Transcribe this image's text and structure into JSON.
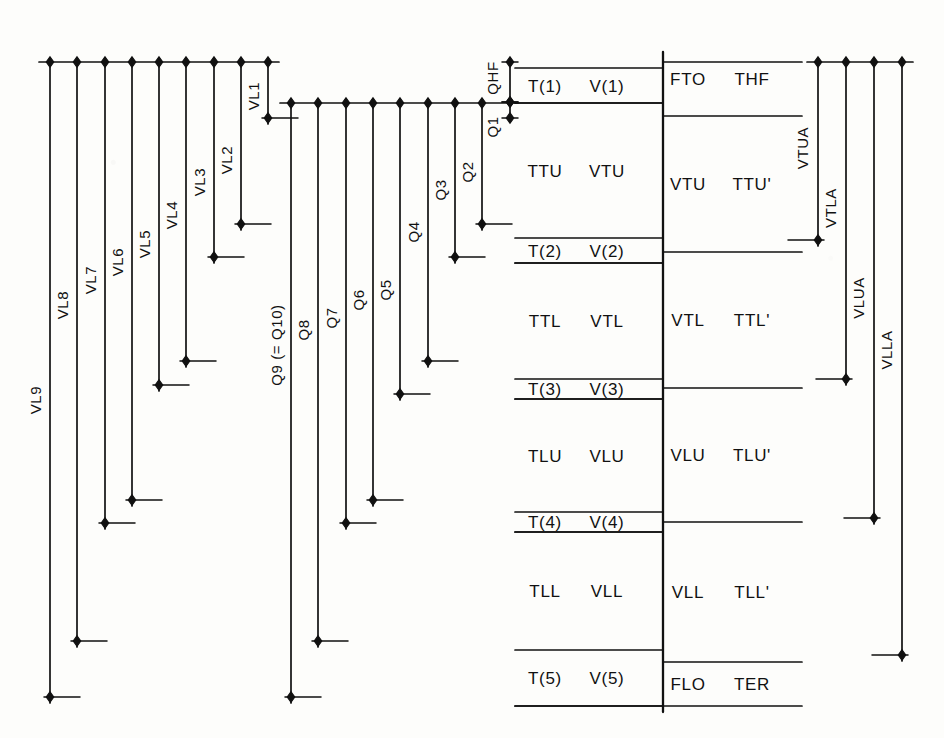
{
  "figure": {
    "kind": "engineering-level-diagram",
    "style": "hand-drawn-ink",
    "width": 944,
    "height": 738,
    "background_color": "#fdfdfb",
    "ink_color": "#111111"
  },
  "panels": {
    "left": {
      "name": "vertical-level-panel",
      "bus_y": 62,
      "x_start": 50,
      "x_step": 27.2,
      "tick_len": 30,
      "lines": [
        {
          "label": "VL9",
          "x": 50,
          "end_y": 697,
          "label_y": 400
        },
        {
          "label": "VL8",
          "x": 77,
          "end_y": 641,
          "label_y": 305
        },
        {
          "label": "VL7",
          "x": 105,
          "end_y": 523,
          "label_y": 280
        },
        {
          "label": "VL6",
          "x": 132,
          "end_y": 500,
          "label_y": 262
        },
        {
          "label": "VL5",
          "x": 159,
          "end_y": 385,
          "label_y": 244
        },
        {
          "label": "VL4",
          "x": 186,
          "end_y": 361,
          "label_y": 215
        },
        {
          "label": "VL3",
          "x": 214,
          "end_y": 257,
          "label_y": 182
        },
        {
          "label": "VL2",
          "x": 241,
          "end_y": 224,
          "label_y": 160
        },
        {
          "label": "VL1",
          "x": 268,
          "end_y": 118,
          "label_y": 96
        }
      ]
    },
    "middle": {
      "name": "charge-level-panel",
      "bus_y": 103,
      "x_start": 291,
      "x_step": 27.4,
      "tick_len": 30,
      "lines": [
        {
          "label": "Q9  (= Q10)",
          "x": 291,
          "end_y": 697,
          "label_y": 345
        },
        {
          "label": "Q8",
          "x": 318,
          "end_y": 641,
          "label_y": 330
        },
        {
          "label": "Q7",
          "x": 346,
          "end_y": 523,
          "label_y": 318
        },
        {
          "label": "Q6",
          "x": 373,
          "end_y": 500,
          "label_y": 300
        },
        {
          "label": "Q5",
          "x": 400,
          "end_y": 394,
          "label_y": 290
        },
        {
          "label": "Q4",
          "x": 428,
          "end_y": 361,
          "label_y": 232
        },
        {
          "label": "Q3",
          "x": 455,
          "end_y": 257,
          "label_y": 190
        },
        {
          "label": "Q2",
          "x": 482,
          "end_y": 224,
          "label_y": 172
        }
      ],
      "stack": [
        {
          "label": "QHF",
          "x": 510,
          "top_y": 62,
          "bottom_y": 102,
          "label_y": 78
        },
        {
          "label": "Q1",
          "x": 510,
          "top_y": 102,
          "bottom_y": 118,
          "label_y": 127
        }
      ]
    },
    "table": {
      "name": "transition-voltage-table",
      "x_left": 515,
      "x_mid": 663,
      "x_right": 802,
      "col_left_labels_x": [
        545,
        607
      ],
      "col_right_labels_x": [
        688,
        752
      ],
      "rows": [
        {
          "kind": "node",
          "y_top": 68,
          "y_bot": 103,
          "left": "T(1)",
          "right": "V(1)"
        },
        {
          "kind": "interval",
          "y_top": 103,
          "y_bot": 238,
          "left": "TTU",
          "right": "VTU"
        },
        {
          "kind": "node",
          "y_top": 238,
          "y_bot": 263,
          "left": "T(2)",
          "right": "V(2)"
        },
        {
          "kind": "interval",
          "y_top": 263,
          "y_bot": 379,
          "left": "TTL",
          "right": "VTL"
        },
        {
          "kind": "node",
          "y_top": 379,
          "y_bot": 399,
          "left": "T(3)",
          "right": "V(3)"
        },
        {
          "kind": "interval",
          "y_top": 399,
          "y_bot": 512,
          "left": "TLU",
          "right": "VLU"
        },
        {
          "kind": "node",
          "y_top": 512,
          "y_bot": 532,
          "left": "T(4)",
          "right": "V(4)"
        },
        {
          "kind": "interval",
          "y_top": 532,
          "y_bot": 650,
          "left": "TLL",
          "right": "VLL"
        },
        {
          "kind": "node",
          "y_top": 650,
          "y_bot": 706,
          "left": "T(5)",
          "right": "V(5)"
        }
      ],
      "right_rows": [
        {
          "y_top": 62,
          "y_bot": 96,
          "a": "FTO",
          "b": "THF"
        },
        {
          "y_top": 116,
          "y_bot": 252,
          "a": "VTU",
          "b": "TTU'"
        },
        {
          "y_top": 252,
          "y_bot": 388,
          "a": "VTL",
          "b": "TTL'"
        },
        {
          "y_top": 388,
          "y_bot": 522,
          "a": "VLU",
          "b": "TLU'"
        },
        {
          "y_top": 522,
          "y_bot": 662,
          "a": "VLL",
          "b": "TLL'"
        },
        {
          "y_top": 662,
          "y_bot": 706,
          "a": "FLO",
          "b": "TER"
        }
      ]
    },
    "right": {
      "name": "aggregate-level-panel",
      "bus_y": 62,
      "tick_len": 30,
      "lines": [
        {
          "label": "VTUA",
          "x": 818,
          "end_y": 240,
          "label_y": 148
        },
        {
          "label": "VTLA",
          "x": 846,
          "end_y": 379,
          "label_y": 208
        },
        {
          "label": "VLUA",
          "x": 874,
          "end_y": 518,
          "label_y": 298
        },
        {
          "label": "VLLA",
          "x": 902,
          "end_y": 655,
          "label_y": 350
        }
      ]
    }
  }
}
